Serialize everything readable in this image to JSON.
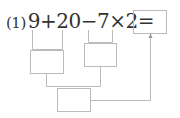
{
  "problem": {
    "label": "(1)",
    "expression": "9+20−7×2=",
    "line_color": "#bbbbbb",
    "text_color": "#333333"
  },
  "boxes": [
    {
      "name": "answer-box",
      "value": ""
    },
    {
      "name": "sum-box",
      "value": ""
    },
    {
      "name": "product-box",
      "value": ""
    },
    {
      "name": "difference-box",
      "value": ""
    }
  ]
}
